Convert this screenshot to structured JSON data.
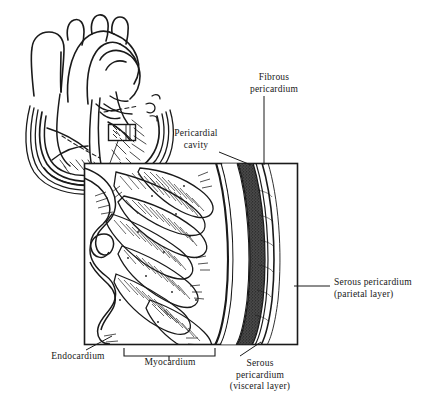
{
  "figure": {
    "background_color": "#ffffff",
    "ink_color": "#1a1a1a"
  },
  "labels": {
    "fibrous_pericardium": "Fibrous\npericardium",
    "pericardial_cavity": "Pericardial\ncavity",
    "serous_pericardium_parietal": "Serous pericardium\n(parietal layer)",
    "endocardium": "Endocardium",
    "myocardium": "Myocardium",
    "serous_pericardium_visceral": "Serous\npericardium\n(visceral layer)"
  },
  "structures": [
    {
      "name": "heart-cross-section",
      "position": "upper-left"
    },
    {
      "name": "callout-rectangle-on-heart-wall",
      "position": "left-ventricle-wall"
    },
    {
      "name": "magnified-wall-box",
      "position": "center"
    },
    {
      "name": "endocardium-trabeculae",
      "position": "box-left-edge"
    },
    {
      "name": "myocardium-muscle-bundles",
      "position": "box-middle"
    },
    {
      "name": "visceral-serous-layer",
      "position": "box-right"
    },
    {
      "name": "pericardial-cavity-gap",
      "position": "box-right"
    },
    {
      "name": "fibrous-pericardium-band",
      "position": "box-far-right"
    }
  ],
  "brackets": [
    {
      "name": "myocardium-bracket",
      "label": "Myocardium"
    }
  ]
}
